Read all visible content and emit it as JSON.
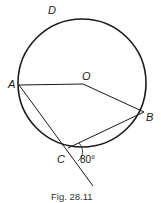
{
  "figure": {
    "caption": "Fig. 28.11",
    "type": "circle-geometry"
  },
  "points": {
    "D": {
      "label": "D"
    },
    "A": {
      "label": "A"
    },
    "O": {
      "label": "O"
    },
    "B": {
      "label": "B"
    },
    "C": {
      "label": "C"
    }
  },
  "angle": {
    "label": "80°",
    "vertex": "C"
  },
  "colors": {
    "stroke": "#1a1a1a",
    "background": "#ffffff"
  }
}
